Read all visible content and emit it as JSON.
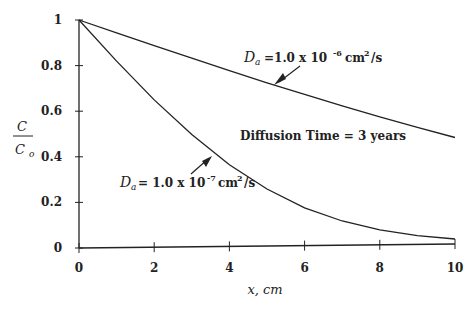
{
  "chart_data": {
    "type": "line",
    "title": "",
    "xlabel": "x, cm",
    "ylabel": "C / C_o",
    "ylabel_num": "C",
    "ylabel_den": "C",
    "ylabel_den_sub": "o",
    "xlim": [
      0,
      10
    ],
    "ylim": [
      0,
      1
    ],
    "x_ticks": [
      "0",
      "2",
      "4",
      "6",
      "8",
      "10"
    ],
    "y_ticks": [
      "0",
      "0.2",
      "0.4",
      "0.6",
      "0.8",
      "1"
    ],
    "grid": false,
    "x": [
      0,
      1,
      2,
      3,
      4,
      5,
      6,
      7,
      8,
      9,
      10
    ],
    "series": [
      {
        "name": "D_a = 1.0 x 10^-6 cm^2/s",
        "values": [
          1.0,
          0.942,
          0.884,
          0.827,
          0.771,
          0.716,
          0.663,
          0.611,
          0.561,
          0.513,
          0.467
        ]
      },
      {
        "name": "D_a = 1.0 x 10^-7 cm^2/s",
        "values": [
          1.0,
          0.818,
          0.646,
          0.492,
          0.358,
          0.25,
          0.166,
          0.106,
          0.066,
          0.038,
          0.022
        ]
      }
    ],
    "annotations": [
      {
        "text": "Diffusion Time = 3 years"
      },
      {
        "prefix": "D",
        "sub": "a",
        "text": "=1.0 x 10",
        "exp": "-6",
        "unit": "cm",
        "unit_exp": "2",
        "tail": "/s"
      },
      {
        "prefix": "D",
        "sub": "a",
        "text": "= 1.0 x 10",
        "exp": "-7",
        "unit": "cm",
        "unit_exp": "2",
        "tail": "/s"
      }
    ]
  }
}
